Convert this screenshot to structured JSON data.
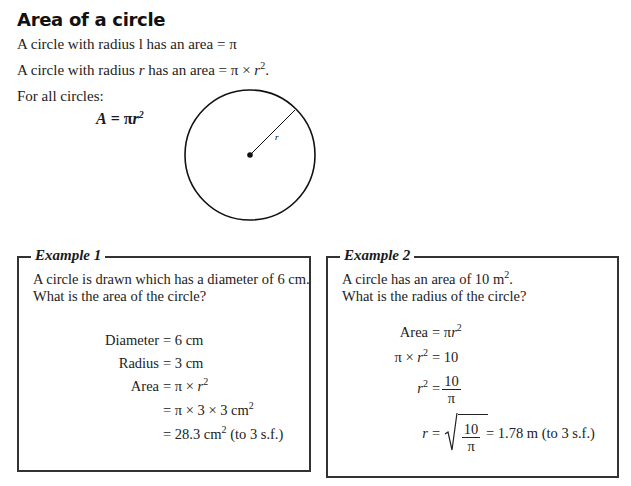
{
  "page": {
    "title": "Area of a circle",
    "lines": [
      "A circle with radius 1 has an area = π",
      "A circle with radius r has an area = π × r².",
      "For all circles:"
    ],
    "line1": "A circle with radius l has an area = π",
    "line2_prefix": "A circle with radius ",
    "line2_var": "r",
    "line2_mid": " has an area = π × ",
    "line2_var2": "r",
    "line2_sup": "2",
    "line2_end": ".",
    "line3": "For all circles:",
    "formula": {
      "lhs": "A",
      "eq": " = π",
      "var": "r",
      "sup": "2"
    },
    "diagram": {
      "radius_label": "r"
    }
  },
  "example1": {
    "title": "Example 1",
    "question": [
      "A circle is drawn which has a diameter of 6 cm.",
      "What is the area of the circle?"
    ],
    "steps": [
      {
        "lhs": "Diameter",
        "rhs": "= 6 cm"
      },
      {
        "lhs": "Radius",
        "rhs": "= 3 cm"
      },
      {
        "lhs": "Area",
        "rhs": "= π × r²"
      },
      {
        "lhs": "",
        "rhs": "= π × 3 × 3 cm²"
      },
      {
        "lhs": "",
        "rhs": "= 28.3 cm² (to 3 s.f.)"
      }
    ],
    "s1_lhs": "Diameter",
    "s1_rhs": "= 6 cm",
    "s2_lhs": "Radius",
    "s2_rhs": "= 3 cm",
    "s3_lhs": "Area",
    "s3_rhs": "= π × ",
    "s3_var": "r",
    "s3_sup": "2",
    "s4_rhs": "= π × 3 × 3 cm",
    "s4_sup": "2",
    "s5_rhs": "= 28.3 cm",
    "s5_sup": "2",
    "s5_end": " (to 3 s.f.)"
  },
  "example2": {
    "title": "Example 2",
    "q1": "A circle has an area of 10 m",
    "q1_sup": "2",
    "q1_end": ".",
    "q2": "What is the radius of the circle?",
    "s1_lhs": "Area",
    "s1_rhs": "= π",
    "s1_var": "r",
    "s1_sup": "2",
    "s2_lhs": "π × ",
    "s2_var": "r",
    "s2_sup": "2",
    "s2_rhs": "= 10",
    "s3_var": "r",
    "s3_sup": "2",
    "s3_eq": "=",
    "s3_num": "10",
    "s3_den": "π",
    "s4_var": "r",
    "s4_eq": "=",
    "s4_num": "10",
    "s4_den": "π",
    "s4_result": "= 1.78 m (to 3 s.f.)"
  }
}
